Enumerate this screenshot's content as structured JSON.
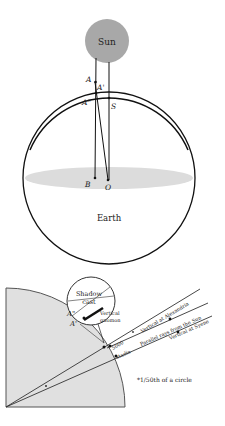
{
  "top_diagram": {
    "sun_label": "Sun",
    "earth_label": "Earth",
    "points": {
      "A": "A",
      "A_prime": "A'",
      "A_double_prime": "A\"",
      "S": "S",
      "B": "B",
      "O": "O"
    }
  },
  "bottom_diagram": {
    "shadow_cast": "Shadow",
    "shadow_cast_2": "cast",
    "vertical_gnomon_1": "Vertical",
    "vertical_gnomon_2": "gnomon",
    "a_double_prime": "A\"",
    "a_prime": "A'",
    "vertical_alexandria": "Vertical at Alexandria",
    "parallel_rays": "Parallel rays from the Sun",
    "vertical_syene": "Vertical at Syene",
    "distance_1": "5000",
    "distance_2": "stadia",
    "note": "*1/50th of a circle"
  },
  "colors": {
    "sun": "#a8a8a8",
    "plane": "#dcdcdc",
    "quadrant": "#e0e0e0",
    "line": "#111111"
  }
}
